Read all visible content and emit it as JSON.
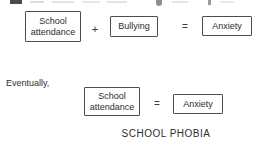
{
  "colors": {
    "background": "#ffffff",
    "text": "#2e2e2e",
    "box_border": "#4d4d4d"
  },
  "figure": {
    "row1": {
      "school_attendance_box": {
        "line1": "School",
        "line2": "attendance"
      },
      "plus_sign": "+",
      "bullying_box": "Bullying",
      "equals_sign": "=",
      "anxiety_box": "Anxiety"
    },
    "eventually_label": "Eventually,",
    "row2": {
      "school_attendance_box": {
        "line1": "School",
        "line2": "attendance"
      },
      "equals_sign": "=",
      "anxiety_box": "Anxiety"
    },
    "caption": "SCHOOL PHOBIA"
  }
}
